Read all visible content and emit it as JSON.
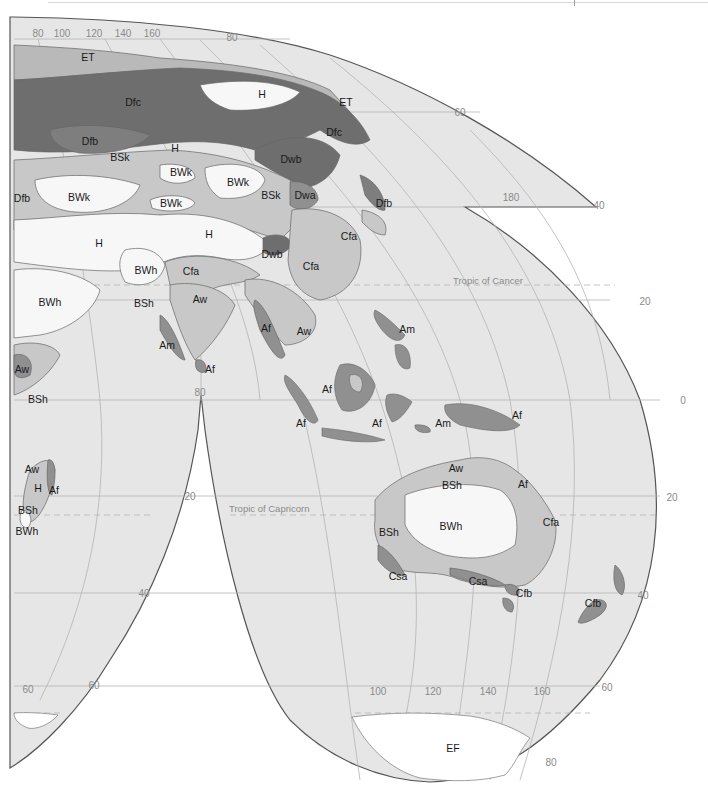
{
  "map": {
    "type": "climate-classification-map",
    "projection": "interrupted",
    "colors": {
      "ocean": "#e6e6e6",
      "H_BW": "#f7f7f7",
      "BS_Cf_Aw": "#c8c8c8",
      "Am_Af_Cs_Cfb": "#909090",
      "D_dark": "#6e6e6e",
      "ET": "#b9b9b9",
      "EF": "#ffffff",
      "border": "#555555",
      "grid": "#b4b4b4",
      "label": "#1a1a1a",
      "grid_label": "#8a8a8a"
    },
    "longitude_labels_top": [
      "80",
      "100",
      "120",
      "140",
      "160"
    ],
    "longitude_labels_bottom": [
      "100",
      "120",
      "140",
      "160"
    ],
    "latitude_labels": {
      "top_arc": "80",
      "upper_right": "60",
      "right_notch": "40",
      "notch_lon": "180",
      "right_20": "20",
      "equator_right": "0",
      "indian_80": "80",
      "indian_20": "20",
      "right_s20": "20",
      "left_40": "40",
      "right_s40": "40",
      "left_60_a": "60",
      "left_60_b": "60",
      "right_s60": "60",
      "bottom_80": "80"
    },
    "tropics": {
      "cancer": "Tropic of Cancer",
      "capricorn": "Tropic of Capricorn"
    },
    "climate_labels": [
      {
        "code": "ET",
        "x": 88,
        "y": 57
      },
      {
        "code": "Dfc",
        "x": 133,
        "y": 102
      },
      {
        "code": "H",
        "x": 262,
        "y": 94
      },
      {
        "code": "ET",
        "x": 346,
        "y": 102
      },
      {
        "code": "Dfc",
        "x": 334,
        "y": 132
      },
      {
        "code": "Dfb",
        "x": 90,
        "y": 141
      },
      {
        "code": "BSk",
        "x": 120,
        "y": 157
      },
      {
        "code": "H",
        "x": 175,
        "y": 148
      },
      {
        "code": "Dwb",
        "x": 291,
        "y": 159
      },
      {
        "code": "BWk",
        "x": 181,
        "y": 172
      },
      {
        "code": "BWk",
        "x": 238,
        "y": 182
      },
      {
        "code": "Dfb",
        "x": 22,
        "y": 198
      },
      {
        "code": "BWk",
        "x": 79,
        "y": 197
      },
      {
        "code": "BWk",
        "x": 171,
        "y": 203
      },
      {
        "code": "BSk",
        "x": 271,
        "y": 195
      },
      {
        "code": "Dwa",
        "x": 305,
        "y": 195
      },
      {
        "code": "Dfb",
        "x": 384,
        "y": 203
      },
      {
        "code": "Cfa",
        "x": 349,
        "y": 236
      },
      {
        "code": "H",
        "x": 99,
        "y": 243
      },
      {
        "code": "H",
        "x": 209,
        "y": 234
      },
      {
        "code": "Dwb",
        "x": 272,
        "y": 254
      },
      {
        "code": "Cfa",
        "x": 311,
        "y": 266
      },
      {
        "code": "BWh",
        "x": 146,
        "y": 270
      },
      {
        "code": "Cfa",
        "x": 191,
        "y": 271
      },
      {
        "code": "BWh",
        "x": 50,
        "y": 302
      },
      {
        "code": "BSh",
        "x": 144,
        "y": 303
      },
      {
        "code": "Aw",
        "x": 200,
        "y": 299
      },
      {
        "code": "Af",
        "x": 266,
        "y": 328
      },
      {
        "code": "Aw",
        "x": 304,
        "y": 331
      },
      {
        "code": "Am",
        "x": 407,
        "y": 329
      },
      {
        "code": "Am",
        "x": 167,
        "y": 345
      },
      {
        "code": "Af",
        "x": 210,
        "y": 369
      },
      {
        "code": "Aw",
        "x": 22,
        "y": 369
      },
      {
        "code": "BSh",
        "x": 38,
        "y": 399
      },
      {
        "code": "Af",
        "x": 327,
        "y": 389
      },
      {
        "code": "Af",
        "x": 301,
        "y": 423
      },
      {
        "code": "Af",
        "x": 377,
        "y": 423
      },
      {
        "code": "Am",
        "x": 443,
        "y": 423
      },
      {
        "code": "Af",
        "x": 517,
        "y": 415
      },
      {
        "code": "Aw",
        "x": 32,
        "y": 469
      },
      {
        "code": "Aw",
        "x": 456,
        "y": 468
      },
      {
        "code": "H",
        "x": 38,
        "y": 488
      },
      {
        "code": "Af",
        "x": 54,
        "y": 490
      },
      {
        "code": "BSh",
        "x": 452,
        "y": 485
      },
      {
        "code": "Af",
        "x": 523,
        "y": 484
      },
      {
        "code": "BSh",
        "x": 28,
        "y": 510
      },
      {
        "code": "BWh",
        "x": 27,
        "y": 531
      },
      {
        "code": "BWh",
        "x": 451,
        "y": 526
      },
      {
        "code": "BSh",
        "x": 389,
        "y": 532
      },
      {
        "code": "Cfa",
        "x": 551,
        "y": 522
      },
      {
        "code": "Csa",
        "x": 398,
        "y": 576
      },
      {
        "code": "Csa",
        "x": 478,
        "y": 581
      },
      {
        "code": "Cfb",
        "x": 524,
        "y": 593
      },
      {
        "code": "Cfb",
        "x": 593,
        "y": 603
      },
      {
        "code": "EF",
        "x": 453,
        "y": 748
      }
    ]
  }
}
